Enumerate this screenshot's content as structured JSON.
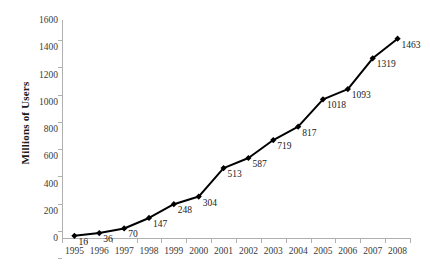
{
  "chart_data": {
    "type": "line",
    "title": "",
    "xlabel": "",
    "ylabel": "Millions of Users",
    "categories": [
      "1995",
      "1996",
      "1997",
      "1998",
      "1999",
      "2000",
      "2001",
      "2002",
      "2003",
      "2004",
      "2005",
      "2006",
      "2007",
      "2008"
    ],
    "values": [
      16,
      36,
      70,
      147,
      248,
      304,
      513,
      587,
      719,
      817,
      1018,
      1093,
      1319,
      1463
    ],
    "series": [
      {
        "name": "Millions of Users",
        "values": [
          16,
          36,
          70,
          147,
          248,
          304,
          513,
          587,
          719,
          817,
          1018,
          1093,
          1319,
          1463
        ]
      }
    ],
    "point_labels": [
      "16",
      "36",
      "70",
      "147",
      "248",
      "304",
      "513",
      "587",
      "719",
      "817",
      "1018",
      "1093",
      "1319",
      "1463"
    ],
    "ylim": [
      0,
      1600
    ],
    "y_ticks": [
      "0",
      "200",
      "400",
      "600",
      "800",
      "1000",
      "1200",
      "1400",
      "1600"
    ],
    "y_tick_values": [
      0,
      200,
      400,
      600,
      800,
      1000,
      1200,
      1400,
      1600
    ],
    "grid": false,
    "legend": false,
    "legend_position": "none",
    "marker": "diamond",
    "line_color": "#000000",
    "marker_color": "#000000",
    "axis_color": "#b0b0b0",
    "label_color": "#1a1a1a",
    "background_color": "#ffffff"
  }
}
